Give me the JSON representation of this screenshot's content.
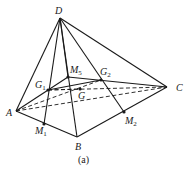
{
  "figure": {
    "caption": "(a)"
  },
  "points": [
    {
      "id": "D",
      "label": "D",
      "sub": ""
    },
    {
      "id": "A",
      "label": "A",
      "sub": ""
    },
    {
      "id": "B",
      "label": "B",
      "sub": ""
    },
    {
      "id": "C",
      "label": "C",
      "sub": ""
    },
    {
      "id": "M5",
      "label": "M",
      "sub": "5"
    },
    {
      "id": "G1",
      "label": "G",
      "sub": "1"
    },
    {
      "id": "G2",
      "label": "G",
      "sub": "2"
    },
    {
      "id": "G",
      "label": "G",
      "sub": ""
    },
    {
      "id": "M1",
      "label": "M",
      "sub": "1"
    },
    {
      "id": "M2",
      "label": "M",
      "sub": "2"
    }
  ],
  "segments": {
    "solid": [
      [
        "D",
        "A"
      ],
      [
        "D",
        "B"
      ],
      [
        "D",
        "C"
      ],
      [
        "A",
        "B"
      ],
      [
        "B",
        "C"
      ],
      [
        "D",
        "M1"
      ],
      [
        "D",
        "M5"
      ],
      [
        "D",
        "M2"
      ],
      [
        "A",
        "M5"
      ],
      [
        "M5",
        "C"
      ],
      [
        "G1",
        "G2"
      ]
    ],
    "dashed": [
      [
        "A",
        "C"
      ],
      [
        "A",
        "G2"
      ],
      [
        "G1",
        "C"
      ],
      [
        "G1",
        "G"
      ]
    ]
  }
}
